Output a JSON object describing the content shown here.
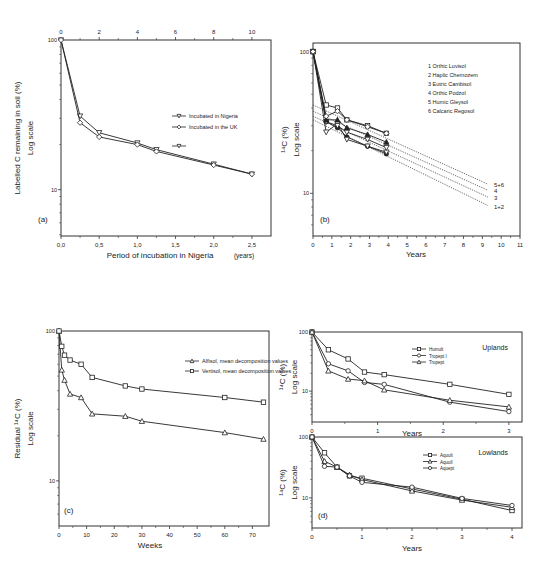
{
  "figure": {
    "panels": [
      "a",
      "b",
      "c",
      "d-uplands",
      "d-lowlands"
    ]
  },
  "chart_data": [
    {
      "id": "a",
      "type": "line",
      "panel_label": "(a)",
      "title": "",
      "xlabel": "Period of incubation in  Nigeria",
      "xlabel_unit": "(years)",
      "ylabel": "Labelled C remaining in soil (%)",
      "ylabel2": "Log scale",
      "yscale": "log",
      "xlim": [
        0,
        2.75
      ],
      "ylim": [
        4.9,
        100
      ],
      "xticks": [
        0,
        0.5,
        1.0,
        1.5,
        2.0,
        2.5
      ],
      "xtick_labels": [
        "0,0",
        "0,5",
        "1,0",
        "1,5",
        "2,0",
        "2,5"
      ],
      "yticks": [
        10,
        100
      ],
      "ytick_labels": [
        "10",
        "100"
      ],
      "top_axis": {
        "ticks": [
          0,
          2,
          4,
          6,
          8,
          10
        ],
        "labels": [
          "0",
          "2",
          "4",
          "6",
          "8",
          "10"
        ],
        "max": 11
      },
      "legend": {
        "position": "upper right (inside)"
      },
      "series": [
        {
          "name": "Incubated in Nigeria",
          "marker": "triangle-down",
          "x": [
            0,
            0.25,
            0.5,
            1.0,
            1.25,
            2.0,
            2.5
          ],
          "y": [
            100,
            31,
            24,
            20.5,
            18.5,
            14.8,
            12.7
          ]
        },
        {
          "name": "Incubated in the UK",
          "marker": "diamond",
          "x": [
            0,
            0.25,
            0.5,
            1.0,
            1.25,
            2.0,
            2.5
          ],
          "y": [
            100,
            28,
            22.5,
            20,
            18,
            14.6,
            12.7
          ]
        },
        {
          "name": "",
          "marker": "triangle-down",
          "legend_only": true,
          "x": [],
          "y": []
        }
      ]
    },
    {
      "id": "b",
      "type": "line",
      "panel_label": "(b)",
      "title": "",
      "xlabel": "Years",
      "ylabel": "¹⁴C (%)",
      "ylabel2": "Log scale",
      "yscale": "log",
      "xlim": [
        0,
        11
      ],
      "ylim": [
        5,
        115
      ],
      "xticks": [
        0,
        1,
        2,
        3,
        4,
        5,
        6,
        7,
        8,
        9,
        10,
        11
      ],
      "xtick_labels": [
        "0",
        "1",
        "2",
        "3",
        "4",
        "5",
        "6",
        "7",
        "8",
        "9",
        "10",
        "11"
      ],
      "yticks": [
        10,
        100
      ],
      "ytick_labels": [
        "10",
        "100"
      ],
      "legend": {
        "position": "upper right (inside)"
      },
      "series": [
        {
          "name": "1 Orthic Luvisol",
          "marker": "filled-circle",
          "x": [
            0,
            0.7,
            1.3,
            1.8,
            2.9,
            3.9
          ],
          "y": [
            100,
            32,
            29,
            25,
            21.5,
            19
          ]
        },
        {
          "name": "2 Haplic Chernozem",
          "marker": "triangle-down",
          "x": [
            0,
            0.7,
            1.3,
            1.8,
            2.9,
            3.9
          ],
          "y": [
            100,
            27,
            31,
            24,
            21.5,
            19.5
          ]
        },
        {
          "name": "3 Eutric Cambisol",
          "marker": "triangle-down",
          "x": [
            0,
            0.7,
            1.3,
            1.8,
            2.9,
            3.9
          ],
          "y": [
            100,
            32,
            30,
            27,
            24,
            21
          ]
        },
        {
          "name": "4 Orthic Podzol",
          "marker": "filled-triangle",
          "x": [
            0,
            0.7,
            1.3,
            1.8,
            2.9,
            3.9
          ],
          "y": [
            100,
            33,
            33,
            29,
            26,
            23
          ]
        },
        {
          "name": "5 Humic Gleysol",
          "marker": "square",
          "x": [
            0,
            0.7,
            1.3,
            1.8,
            2.9,
            3.9
          ],
          "y": [
            100,
            42,
            40,
            33,
            30,
            26.5
          ]
        },
        {
          "name": "6 Calcaric Regosol",
          "marker": "diamond",
          "x": [
            0,
            0.7,
            1.3,
            1.8,
            2.9,
            3.9
          ],
          "y": [
            100,
            35,
            38,
            33,
            29.5,
            26.5
          ]
        }
      ],
      "extrapolations": [
        {
          "label": "5+6",
          "x": [
            0,
            9.3
          ],
          "y": [
            42,
            11.6
          ]
        },
        {
          "label": "4",
          "x": [
            0,
            9.3
          ],
          "y": [
            38,
            10.5
          ]
        },
        {
          "label": "3",
          "x": [
            0,
            9.3
          ],
          "y": [
            35,
            9.4
          ]
        },
        {
          "label": "1+2",
          "x": [
            0,
            9.3
          ],
          "y": [
            33,
            8.2
          ]
        }
      ]
    },
    {
      "id": "c",
      "type": "line",
      "panel_label": "(c)",
      "title": "",
      "xlabel": "Weeks",
      "ylabel": "Residual ¹⁴C (%)",
      "ylabel2": "Log scale",
      "yscale": "log",
      "xlim": [
        0,
        76
      ],
      "ylim": [
        5,
        100
      ],
      "xticks": [
        0,
        10,
        20,
        30,
        40,
        50,
        60,
        70
      ],
      "xtick_labels": [
        "0",
        "10",
        "20",
        "30",
        "40",
        "50",
        "60",
        "70"
      ],
      "yticks": [
        10,
        100
      ],
      "ytick_labels": [
        "10",
        "100"
      ],
      "legend": {
        "position": "upper right (inside)"
      },
      "series": [
        {
          "name": "Alfisol, mean decomposition values",
          "marker": "triangle",
          "x": [
            0,
            1,
            2,
            4,
            8,
            12,
            24,
            30,
            60,
            74
          ],
          "y": [
            100,
            55,
            47,
            38,
            36,
            28,
            27,
            25,
            21,
            19
          ]
        },
        {
          "name": "Vertisol, mean decomposition values",
          "marker": "square",
          "x": [
            0,
            1,
            2,
            4,
            8,
            12,
            24,
            30,
            60,
            74
          ],
          "y": [
            100,
            79,
            69,
            64,
            60,
            49,
            43,
            41,
            36,
            33.5
          ]
        }
      ]
    },
    {
      "id": "d-uplands",
      "type": "line",
      "panel_label": "",
      "title": "Uplands",
      "xlabel": "Years",
      "ylabel": "¹⁴C (%)",
      "ylabel2": "Log scale",
      "yscale": "log",
      "xlim": [
        0,
        3.2
      ],
      "ylim": [
        3,
        100
      ],
      "xticks": [
        0,
        1,
        2,
        3
      ],
      "xtick_labels": [
        "0",
        "1",
        "2",
        "3"
      ],
      "yticks": [
        10,
        100
      ],
      "ytick_labels": [
        "10",
        "100"
      ],
      "legend": {
        "position": "upper center (inside)"
      },
      "series": [
        {
          "name": "Humult",
          "marker": "square",
          "x": [
            0,
            0.25,
            0.55,
            0.8,
            1.1,
            2.1,
            3.0
          ],
          "y": [
            100,
            50,
            35,
            21,
            19,
            13,
            8.8
          ]
        },
        {
          "name": "Tropept I",
          "marker": "circle",
          "x": [
            0,
            0.25,
            0.55,
            0.8,
            1.1,
            2.1,
            3.0
          ],
          "y": [
            100,
            29,
            22,
            14,
            13,
            6.5,
            4.5
          ]
        },
        {
          "name": "Tropept",
          "marker": "triangle",
          "x": [
            0,
            0.25,
            0.55,
            0.8,
            1.1,
            2.1,
            3.0
          ],
          "y": [
            100,
            22,
            16,
            15,
            10.5,
            7,
            5.4
          ]
        }
      ]
    },
    {
      "id": "d-lowlands",
      "type": "line",
      "panel_label": "(d)",
      "title": "Lowlands",
      "xlabel": "Years",
      "ylabel": "¹⁴C (%)",
      "ylabel2": "Log scale",
      "yscale": "log",
      "xlim": [
        0,
        4.2
      ],
      "ylim": [
        3.2,
        100
      ],
      "xticks": [
        0,
        1,
        2,
        3,
        4
      ],
      "xtick_labels": [
        "0",
        "1",
        "2",
        "3",
        "4"
      ],
      "yticks": [
        10,
        100
      ],
      "ytick_labels": [
        "10",
        "100"
      ],
      "legend": {
        "position": "upper center (inside)"
      },
      "series": [
        {
          "name": "Aquult",
          "marker": "square",
          "x": [
            0,
            0.25,
            0.5,
            0.75,
            1.0,
            2.0,
            3.0,
            4.0
          ],
          "y": [
            100,
            55,
            32,
            23,
            21,
            14,
            9.5,
            6.2
          ]
        },
        {
          "name": "Aquoll",
          "marker": "triangle",
          "x": [
            0,
            0.25,
            0.5,
            0.75,
            1.0,
            2.0,
            3.0,
            4.0
          ],
          "y": [
            100,
            40,
            32,
            24,
            20,
            13,
            9.2,
            7.0
          ]
        },
        {
          "name": "Aquept",
          "marker": "circle",
          "x": [
            0,
            0.25,
            0.5,
            0.75,
            1.0,
            2.0,
            3.0,
            4.0
          ],
          "y": [
            100,
            33,
            32,
            23,
            18,
            15,
            9.8,
            7.5
          ]
        }
      ]
    }
  ],
  "layout": {
    "panels": {
      "a": {
        "x0": 61,
        "x1": 271,
        "y0": 40,
        "y1": 236,
        "axis": "bottom",
        "top_axis": true,
        "ylabel_x": 20,
        "ylabel2_x": 33,
        "xlabel_y": 258,
        "xlabel_x": 160,
        "xunit_x": 244,
        "panel_label_pos": [
          38,
          222
        ],
        "legend_pos": [
          172,
          116
        ],
        "legend_dy": 11
      },
      "b": {
        "x0": 313,
        "x1": 520,
        "y0": 43,
        "y1": 236,
        "axis": "bottom",
        "ylabel_x": 287,
        "ylabel2_x": 299,
        "xlabel_y": 257,
        "xlabel_x": 416,
        "panel_label_pos": [
          320,
          222
        ],
        "legend_pos": [
          428,
          66
        ],
        "legend_dy": 9
      },
      "c": {
        "x0": 59,
        "x1": 269,
        "y0": 331,
        "y1": 526,
        "axis": "bottom",
        "ylabel_x": 20,
        "ylabel2_x": 33,
        "xlabel_y": 548,
        "xlabel_x": 150,
        "panel_label_pos": [
          64,
          513
        ],
        "legend_pos": [
          185,
          361
        ],
        "legend_dy": 10
      },
      "d-uplands": {
        "x0": 312,
        "x1": 522,
        "y0": 332,
        "y1": 422,
        "axis": "bottom",
        "ylabel_x": 285,
        "ylabel2_x": 297,
        "xlabel_y": 436,
        "xlabel_x": 412,
        "title_pos": [
          508,
          350
        ],
        "legend_pos": [
          412,
          349
        ],
        "legend_dy": 6.5
      },
      "d-lowlands": {
        "x0": 312,
        "x1": 522,
        "y0": 437,
        "y1": 528,
        "axis": "bottom",
        "ylabel_x": 285,
        "ylabel2_x": 297,
        "xlabel_y": 551,
        "xlabel_x": 412,
        "title_pos": [
          508,
          455
        ],
        "panel_label_pos": [
          318,
          518
        ],
        "legend_pos": [
          423,
          455
        ],
        "legend_dy": 6.5
      }
    }
  }
}
